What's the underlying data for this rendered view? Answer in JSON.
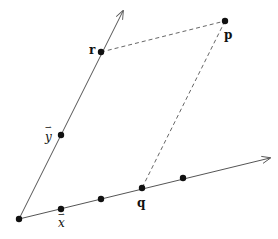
{
  "diagram": {
    "title": "",
    "colors": {
      "axis": "#555555",
      "dash": "#555555",
      "point": "#111111",
      "label": "#111111"
    },
    "origin": {
      "x": 19,
      "y": 219
    },
    "axes": [
      {
        "name": "x-axis",
        "from": {
          "x": 19,
          "y": 219
        },
        "to": {
          "x": 270,
          "y": 158
        }
      },
      {
        "name": "y-axis",
        "from": {
          "x": 19,
          "y": 219
        },
        "to": {
          "x": 123,
          "y": 11
        }
      }
    ],
    "points": [
      {
        "id": "origin",
        "x": 19,
        "y": 219,
        "label": ""
      },
      {
        "id": "x-unit",
        "x": 61,
        "y": 209,
        "label": "x"
      },
      {
        "id": "x-2",
        "x": 101,
        "y": 199,
        "label": ""
      },
      {
        "id": "q",
        "x": 142,
        "y": 188,
        "label": "q"
      },
      {
        "id": "x-4",
        "x": 183,
        "y": 178,
        "label": ""
      },
      {
        "id": "y-unit",
        "x": 61,
        "y": 135,
        "label": "y"
      },
      {
        "id": "r",
        "x": 101,
        "y": 52,
        "label": "r"
      },
      {
        "id": "p",
        "x": 225,
        "y": 21,
        "label": "p"
      }
    ],
    "dashed_lines": [
      {
        "from": "r",
        "to": "p"
      },
      {
        "from": "p",
        "to": "q"
      }
    ],
    "labels": {
      "r": "r",
      "p": "p",
      "q": "q",
      "x_vec": "x",
      "y_vec": "y",
      "vec_arrow": "⇀"
    }
  }
}
